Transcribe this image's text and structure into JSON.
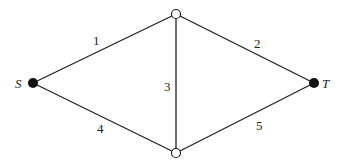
{
  "diagram": {
    "type": "graph",
    "nodes": [
      {
        "id": "S",
        "label": "S",
        "x": 33,
        "y": 83,
        "filled": true
      },
      {
        "id": "A",
        "label": "",
        "x": 176,
        "y": 14,
        "filled": false
      },
      {
        "id": "B",
        "label": "",
        "x": 176,
        "y": 153,
        "filled": false
      },
      {
        "id": "T",
        "label": "T",
        "x": 314,
        "y": 83,
        "filled": true
      }
    ],
    "edges": [
      {
        "from": "S",
        "to": "A",
        "label": "1"
      },
      {
        "from": "A",
        "to": "T",
        "label": "2"
      },
      {
        "from": "A",
        "to": "B",
        "label": "3"
      },
      {
        "from": "S",
        "to": "B",
        "label": "4"
      },
      {
        "from": "B",
        "to": "T",
        "label": "5"
      }
    ]
  },
  "labels": {
    "source": "S",
    "sink": "T",
    "e1": "1",
    "e2": "2",
    "e3": "3",
    "e4": "4",
    "e5": "5"
  },
  "colors": {
    "line": "#222222",
    "node_fill": "#111111",
    "open_node_fill": "#ffffff"
  }
}
